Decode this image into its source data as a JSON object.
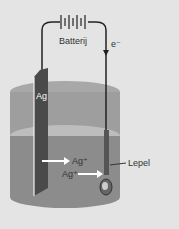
{
  "diagram": {
    "battery_label": "Batterij",
    "electron_label": "e⁻",
    "electrode_label": "Ag",
    "spoon_label": "Lepel",
    "ion_label_1": "Ag⁺",
    "ion_label_2": "Ag⁺"
  },
  "colors": {
    "background": "#e4e4e4",
    "beaker": "#9a9a9a",
    "liquid": "#8a8a8a",
    "electrode": "#4a4a4a",
    "wire": "#222222",
    "arrow": "#ffffff"
  }
}
